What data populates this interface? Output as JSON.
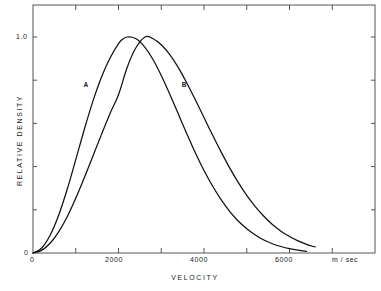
{
  "chart_data": {
    "type": "line",
    "title": "",
    "xlabel": "VELOCITY",
    "ylabel": "RELATIVE DENSITY",
    "xunit": "m / sec",
    "xlim": [
      0,
      8000
    ],
    "ylim": [
      0,
      1.12
    ],
    "grid": false,
    "legend": "inline-curve-labels",
    "x_tick_labels": [
      "0",
      "2000",
      "4000",
      "6000"
    ],
    "x_tick_values": [
      0,
      2000,
      4000,
      6000
    ],
    "x_minor_tick_values": [
      1000,
      3000,
      5000,
      7000
    ],
    "y_tick_labels": [
      "0",
      "1.0"
    ],
    "y_tick_values": [
      0,
      1.0
    ],
    "y_minor_tick_values": [
      0.2,
      0.4,
      0.6,
      0.8
    ],
    "series": [
      {
        "name": "A",
        "label_x": 1250,
        "label_y": 0.78,
        "peak_x": 2100,
        "peak_y": 1.0,
        "x": [
          0,
          200,
          400,
          600,
          800,
          1000,
          1200,
          1400,
          1600,
          1800,
          2000,
          2100,
          2200,
          2400,
          2600,
          2800,
          3000,
          3200,
          3400,
          3600,
          3800,
          4000,
          4200,
          4400,
          4600,
          4800,
          5000,
          5200,
          5400,
          5600,
          5800,
          6000,
          6200,
          6400
        ],
        "values": [
          0.0,
          0.022,
          0.082,
          0.175,
          0.295,
          0.432,
          0.572,
          0.702,
          0.814,
          0.902,
          0.969,
          0.99,
          1.0,
          0.993,
          0.957,
          0.898,
          0.822,
          0.735,
          0.643,
          0.551,
          0.463,
          0.382,
          0.31,
          0.247,
          0.193,
          0.148,
          0.112,
          0.083,
          0.06,
          0.043,
          0.03,
          0.02,
          0.013,
          0.008
        ]
      },
      {
        "name": "B",
        "label_x": 3550,
        "label_y": 0.78,
        "peak_x": 2620,
        "peak_y": 1.0,
        "x": [
          0,
          200,
          400,
          600,
          800,
          1000,
          1200,
          1400,
          1600,
          1800,
          2000,
          2200,
          2400,
          2620,
          2800,
          3000,
          3200,
          3400,
          3600,
          3800,
          4000,
          4200,
          4400,
          4600,
          4800,
          5000,
          5200,
          5400,
          5600,
          5800,
          6000,
          6200,
          6400,
          6600
        ],
        "values": [
          0.0,
          0.012,
          0.045,
          0.098,
          0.168,
          0.253,
          0.348,
          0.448,
          0.548,
          0.645,
          0.733,
          0.858,
          0.948,
          1.0,
          0.993,
          0.964,
          0.918,
          0.858,
          0.786,
          0.708,
          0.627,
          0.546,
          0.468,
          0.394,
          0.327,
          0.267,
          0.215,
          0.17,
          0.132,
          0.101,
          0.076,
          0.056,
          0.04,
          0.028
        ]
      }
    ],
    "colors": {
      "curve": "#111111",
      "axis": "#555555",
      "background": "#ffffff",
      "text": "#1a1a1a"
    }
  },
  "geometry": {
    "plot_left": 33,
    "plot_right": 375,
    "plot_top": 5,
    "plot_bottom": 253,
    "x_pixels_per_unit": 0.0428,
    "y_pixels_per_unit": 216
  }
}
